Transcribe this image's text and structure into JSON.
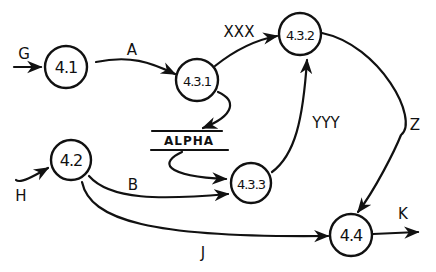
{
  "diagram": {
    "type": "data-flow-diagram",
    "stroke_color": "#111111",
    "background": "#ffffff",
    "nodes": [
      {
        "id": "4.1",
        "label": "4.1",
        "cx": 66,
        "cy": 67,
        "r": 24
      },
      {
        "id": "4.3.1",
        "label": "4.3.1",
        "cx": 198,
        "cy": 80,
        "r": 22
      },
      {
        "id": "4.3.2",
        "label": "4.3.2",
        "cx": 300,
        "cy": 33,
        "r": 22
      },
      {
        "id": "4.2",
        "label": "4.2",
        "cx": 70,
        "cy": 162,
        "r": 22
      },
      {
        "id": "4.3.3",
        "label": "4.3.3",
        "cx": 251,
        "cy": 183,
        "r": 22
      },
      {
        "id": "4.4",
        "label": "4.4",
        "cx": 351,
        "cy": 235,
        "r": 22
      }
    ],
    "data_stores": [
      {
        "id": "ALPHA",
        "label": "ALPHA"
      }
    ],
    "flows": [
      {
        "label": "G",
        "from": "external",
        "to": "4.1"
      },
      {
        "label": "A",
        "from": "4.1",
        "to": "4.3.1"
      },
      {
        "label": "XXX",
        "from": "4.3.1",
        "to": "4.3.2"
      },
      {
        "label": "",
        "from": "4.3.1",
        "to": "ALPHA"
      },
      {
        "label": "",
        "from": "ALPHA",
        "to": "4.3.3"
      },
      {
        "label": "YYY",
        "from": "4.3.3",
        "to": "4.3.2"
      },
      {
        "label": "Z",
        "from": "4.3.2",
        "to": "4.4"
      },
      {
        "label": "H",
        "from": "external",
        "to": "4.2"
      },
      {
        "label": "B",
        "from": "4.2",
        "to": "4.3.3"
      },
      {
        "label": "J",
        "from": "4.2",
        "to": "4.4"
      },
      {
        "label": "K",
        "from": "4.4",
        "to": "external"
      }
    ],
    "labels": {
      "G": "G",
      "A": "A",
      "XXX": "XXX",
      "YYY": "YYY",
      "Z": "Z",
      "H": "H",
      "B": "B",
      "J": "J",
      "K": "K",
      "ALPHA": "ALPHA",
      "n41": "4.1",
      "n431": "4.3.1",
      "n432": "4.3.2",
      "n42": "4.2",
      "n433": "4.3.3",
      "n44": "4.4"
    }
  }
}
